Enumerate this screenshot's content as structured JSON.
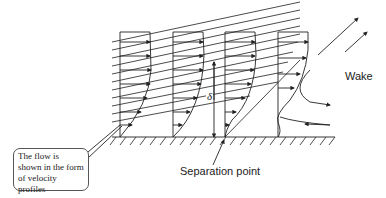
{
  "diagram": {
    "labels": {
      "wake": "Wake",
      "separation_point": "Separation point",
      "thickness_symbol": "δ",
      "callout": "The flow is shown in the form of velocity profiles"
    },
    "wall": {
      "x1": 112,
      "x2": 335,
      "y": 137
    },
    "profiles": [
      {
        "x": 120,
        "state": "attached"
      },
      {
        "x": 173,
        "state": "attached-thicker"
      },
      {
        "x": 225,
        "state": "separation-point"
      },
      {
        "x": 278,
        "state": "reversed-flow"
      }
    ],
    "colors": {
      "line": "#222222",
      "background": "#ffffff"
    }
  }
}
